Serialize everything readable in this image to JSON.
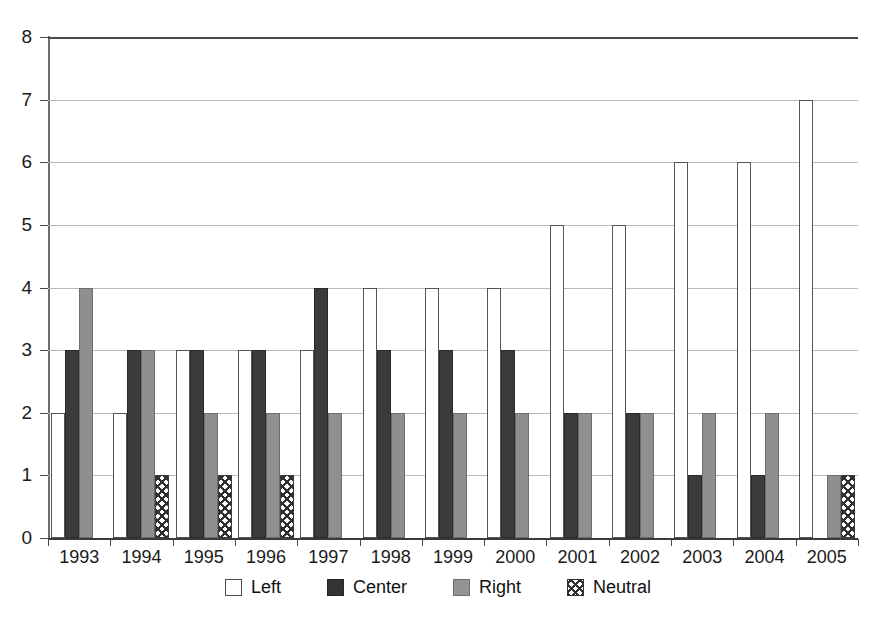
{
  "chart_data": {
    "type": "bar",
    "title": "",
    "subtitle": "",
    "xlabel": "",
    "ylabel": "",
    "ylim": [
      0,
      8
    ],
    "ytick_step": 1,
    "grid": true,
    "legend_position": "bottom",
    "categories": [
      "1993",
      "1994",
      "1995",
      "1996",
      "1997",
      "1998",
      "1999",
      "2000",
      "2001",
      "2002",
      "2003",
      "2004",
      "2005"
    ],
    "ytick_labels": [
      "0",
      "1",
      "2",
      "3",
      "4",
      "5",
      "6",
      "7",
      "8"
    ],
    "series": [
      {
        "name": "Left",
        "color": "#ffffff",
        "pattern": "solid-outline",
        "values": [
          2,
          2,
          3,
          3,
          3,
          4,
          4,
          4,
          5,
          5,
          6,
          6,
          7
        ]
      },
      {
        "name": "Center",
        "color": "#3b3b3b",
        "pattern": "solid-dark",
        "values": [
          3,
          3,
          3,
          3,
          4,
          3,
          3,
          3,
          2,
          2,
          1,
          1,
          0
        ]
      },
      {
        "name": "Right",
        "color": "#8f8f8f",
        "pattern": "solid-gray",
        "values": [
          4,
          3,
          2,
          2,
          2,
          2,
          2,
          2,
          2,
          2,
          2,
          2,
          1
        ]
      },
      {
        "name": "Neutral",
        "color": "#ffffff",
        "pattern": "crosshatch",
        "values": [
          0,
          1,
          1,
          1,
          0,
          0,
          0,
          0,
          0,
          0,
          0,
          0,
          1
        ]
      }
    ]
  },
  "legend": {
    "items": [
      {
        "label": "Left",
        "swatch": "swatch-left-outline"
      },
      {
        "label": "Center",
        "swatch": "swatch-center-dark"
      },
      {
        "label": "Right",
        "swatch": "swatch-right-gray"
      },
      {
        "label": "Neutral",
        "swatch": "swatch-neutral-crosshatch"
      }
    ]
  }
}
